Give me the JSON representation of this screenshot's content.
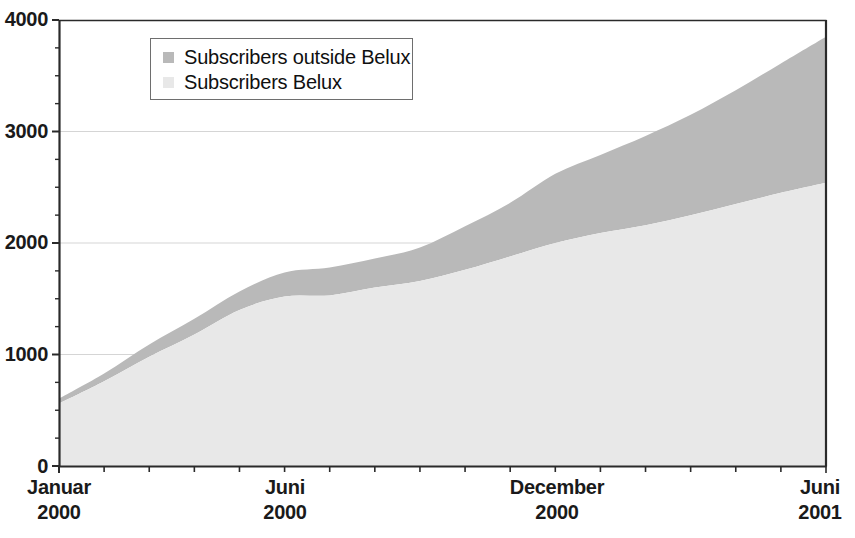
{
  "chart_data": {
    "type": "area",
    "stacked": true,
    "title": "",
    "xlabel": "",
    "ylabel": "",
    "ylim": [
      0,
      4000
    ],
    "ytick_labels": [
      "0",
      "1000",
      "2000",
      "3000",
      "4000"
    ],
    "ytick_values": [
      0,
      1000,
      2000,
      3000,
      4000
    ],
    "yminor_step": 250,
    "grid": "horizontal-major-only",
    "legend_position": "top-left-inside",
    "x": [
      "Januar 2000",
      "Februar 2000",
      "März 2000",
      "April 2000",
      "Mai 2000",
      "Juni 2000",
      "Juli 2000",
      "August 2000",
      "September 2000",
      "Oktober 2000",
      "November 2000",
      "December 2000",
      "Januar 2001",
      "Februar 2001",
      "März 2001",
      "April 2001",
      "Mai 2001",
      "Juni 2001"
    ],
    "xtick_labels": [
      {
        "label": "Januar",
        "year": "2000",
        "index": 0
      },
      {
        "label": "Juni",
        "year": "2000",
        "index": 5
      },
      {
        "label": "December",
        "year": "2000",
        "index": 11
      },
      {
        "label": "Juni",
        "year": "2001",
        "index": 17
      }
    ],
    "series": [
      {
        "name": "Subscribers Belux",
        "color": "#e8e8e8",
        "stack_order": 1,
        "values": [
          560,
          760,
          980,
          1180,
          1400,
          1520,
          1530,
          1600,
          1660,
          1760,
          1880,
          2000,
          2090,
          2160,
          2250,
          2350,
          2450,
          2540
        ]
      },
      {
        "name": "Subscribers outside Belux",
        "color": "#b9b9b9",
        "stack_order": 2,
        "values": [
          45,
          70,
          110,
          140,
          165,
          215,
          250,
          260,
          300,
          390,
          480,
          620,
          700,
          800,
          900,
          1020,
          1160,
          1310
        ]
      }
    ],
    "totals": [
      605,
      830,
      1090,
      1320,
      1565,
      1735,
      1780,
      1860,
      1960,
      2150,
      2360,
      2620,
      2790,
      2960,
      3150,
      3370,
      3610,
      3850
    ]
  },
  "legend": {
    "items": [
      {
        "label": "Subscribers outside Belux",
        "color": "#b9b9b9"
      },
      {
        "label": "Subscribers Belux",
        "color": "#e8e8e8"
      }
    ]
  },
  "axes": {
    "y_labels": [
      "4000",
      "3000",
      "2000",
      "1000",
      "0"
    ],
    "x_labels": [
      {
        "month": "Januar",
        "year": "2000"
      },
      {
        "month": "Juni",
        "year": "2000"
      },
      {
        "month": "December",
        "year": "2000"
      },
      {
        "month": "Juni",
        "year": "2001"
      }
    ]
  },
  "colors": {
    "axis": "#2a2a2a",
    "grid": "#d5d5d5",
    "belux_fill": "#e8e8e8",
    "outside_fill": "#b9b9b9",
    "text": "#1a1a1a"
  }
}
